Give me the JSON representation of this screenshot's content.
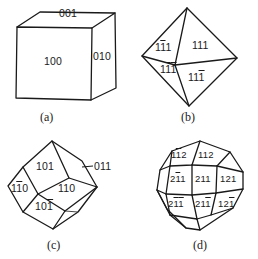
{
  "figure": {
    "panels": [
      {
        "id": "a",
        "caption": "(a)",
        "shape": "cube",
        "faces": [
          {
            "label": "001",
            "parts": [
              "0",
              "0",
              "1"
            ],
            "bars": [
              false,
              false,
              false
            ]
          },
          {
            "label": "100",
            "parts": [
              "1",
              "0",
              "0"
            ],
            "bars": [
              false,
              false,
              false
            ]
          },
          {
            "label": "010",
            "parts": [
              "0",
              "1",
              "0"
            ],
            "bars": [
              false,
              false,
              false
            ]
          }
        ]
      },
      {
        "id": "b",
        "caption": "(b)",
        "shape": "octahedron",
        "faces": [
          {
            "label": "1-11",
            "parts": [
              "1",
              "1",
              "1"
            ],
            "bars": [
              false,
              true,
              false
            ]
          },
          {
            "label": "111",
            "parts": [
              "1",
              "1",
              "1"
            ],
            "bars": [
              false,
              false,
              false
            ]
          },
          {
            "label": "1-1-1",
            "parts": [
              "1",
              "1",
              "1"
            ],
            "bars": [
              false,
              true,
              true
            ]
          },
          {
            "label": "11-1",
            "parts": [
              "1",
              "1",
              "1"
            ],
            "bars": [
              false,
              false,
              true
            ]
          }
        ]
      },
      {
        "id": "c",
        "caption": "(c)",
        "shape": "rhombic-dodecahedron",
        "faces": [
          {
            "label": "101",
            "parts": [
              "1",
              "0",
              "1"
            ],
            "bars": [
              false,
              false,
              false
            ]
          },
          {
            "label": "011",
            "parts": [
              "0",
              "1",
              "1"
            ],
            "bars": [
              false,
              false,
              false
            ]
          },
          {
            "label": "1-10",
            "parts": [
              "1",
              "1",
              "0"
            ],
            "bars": [
              false,
              true,
              false
            ]
          },
          {
            "label": "110",
            "parts": [
              "1",
              "1",
              "0"
            ],
            "bars": [
              false,
              false,
              false
            ]
          },
          {
            "label": "10-1",
            "parts": [
              "1",
              "0",
              "1"
            ],
            "bars": [
              false,
              false,
              true
            ]
          }
        ]
      },
      {
        "id": "d",
        "caption": "(d)",
        "shape": "trapezohedron",
        "faces": [
          {
            "label": "1-12",
            "parts": [
              "1",
              "1",
              "2"
            ],
            "bars": [
              false,
              true,
              false
            ]
          },
          {
            "label": "112",
            "parts": [
              "1",
              "1",
              "2"
            ],
            "bars": [
              false,
              false,
              false
            ]
          },
          {
            "label": "2-11",
            "parts": [
              "2",
              "1",
              "1"
            ],
            "bars": [
              false,
              true,
              false
            ]
          },
          {
            "label": "211",
            "parts": [
              "2",
              "1",
              "1"
            ],
            "bars": [
              false,
              false,
              false
            ]
          },
          {
            "label": "121",
            "parts": [
              "1",
              "2",
              "1"
            ],
            "bars": [
              false,
              false,
              false
            ]
          },
          {
            "label": "2-1-1",
            "parts": [
              "2",
              "1",
              "1"
            ],
            "bars": [
              false,
              true,
              true
            ]
          },
          {
            "label": "21-1",
            "parts": [
              "2",
              "1",
              "1"
            ],
            "bars": [
              false,
              false,
              true
            ]
          },
          {
            "label": "12-1",
            "parts": [
              "1",
              "2",
              "1"
            ],
            "bars": [
              false,
              false,
              true
            ]
          }
        ]
      }
    ]
  }
}
